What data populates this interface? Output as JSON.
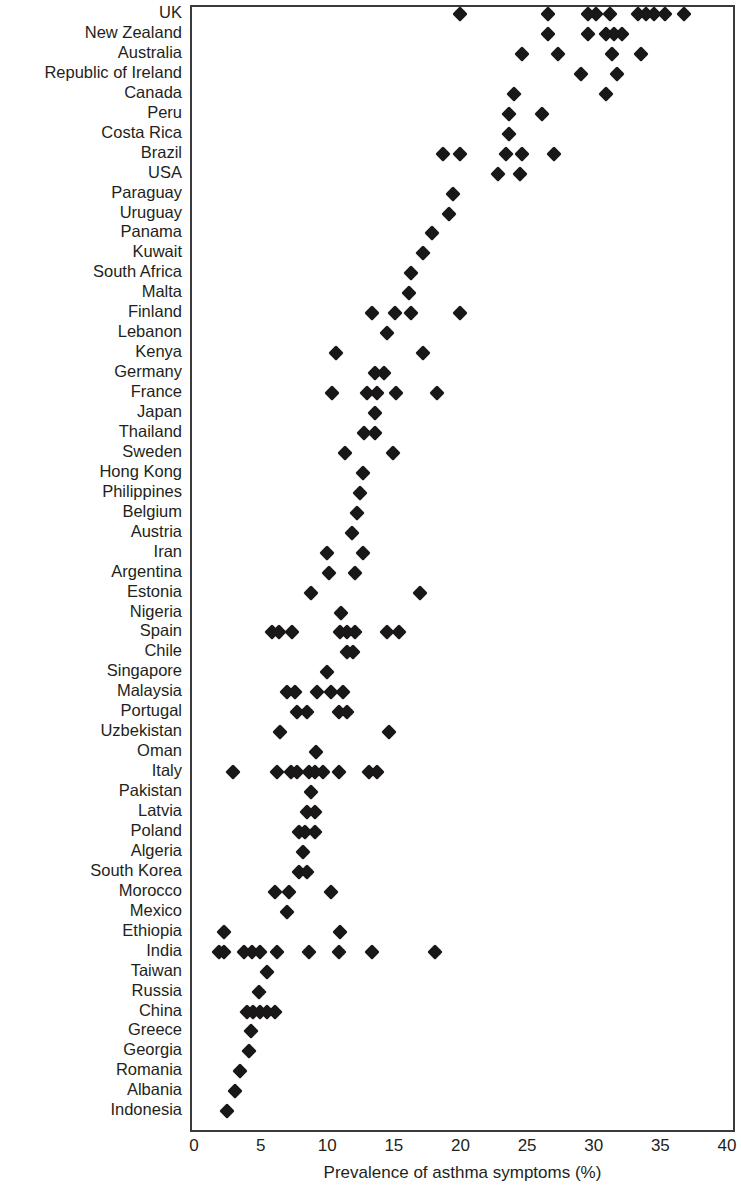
{
  "chart_data": {
    "type": "scatter",
    "title": "",
    "xlabel": "Prevalence of asthma symptoms (%)",
    "ylabel": "Country",
    "xlim": [
      0,
      40
    ],
    "xticks": [
      0,
      5,
      10,
      15,
      20,
      25,
      30,
      35,
      40
    ],
    "grid": false,
    "legend": null,
    "marker": "diamond",
    "marker_color": "#1a1718",
    "categories": [
      "UK",
      "New Zealand",
      "Australia",
      "Republic of Ireland",
      "Canada",
      "Peru",
      "Costa Rica",
      "Brazil",
      "USA",
      "Paraguay",
      "Uruguay",
      "Panama",
      "Kuwait",
      "South Africa",
      "Malta",
      "Finland",
      "Lebanon",
      "Kenya",
      "Germany",
      "France",
      "Japan",
      "Thailand",
      "Sweden",
      "Hong Kong",
      "Philippines",
      "Belgium",
      "Austria",
      "Iran",
      "Argentina",
      "Estonia",
      "Nigeria",
      "Spain",
      "Chile",
      "Singapore",
      "Malaysia",
      "Portugal",
      "Uzbekistan",
      "Oman",
      "Italy",
      "Pakistan",
      "Latvia",
      "Poland",
      "Algeria",
      "South Korea",
      "Morocco",
      "Mexico",
      "Ethiopia",
      "India",
      "Taiwan",
      "Russia",
      "China",
      "Greece",
      "Georgia",
      "Romania",
      "Albania",
      "Indonesia"
    ],
    "points": [
      {
        "country": "UK",
        "values": [
          19.8,
          26.4,
          29.4,
          30.0,
          31.1,
          33.2,
          33.8,
          34.4,
          35.2,
          36.6
        ]
      },
      {
        "country": "New Zealand",
        "values": [
          26.4,
          29.4,
          30.8,
          31.4,
          32.0
        ]
      },
      {
        "country": "Australia",
        "values": [
          24.5,
          27.2,
          31.2,
          33.4
        ]
      },
      {
        "country": "Republic of Ireland",
        "values": [
          28.9,
          31.6
        ]
      },
      {
        "country": "Canada",
        "values": [
          23.9,
          30.8
        ]
      },
      {
        "country": "Peru",
        "values": [
          23.5,
          26.0
        ]
      },
      {
        "country": "Costa Rica",
        "values": [
          23.5
        ]
      },
      {
        "country": "Brazil",
        "values": [
          18.5,
          19.8,
          23.3,
          24.5,
          26.9
        ]
      },
      {
        "country": "USA",
        "values": [
          22.7,
          24.3
        ]
      },
      {
        "country": "Paraguay",
        "values": [
          19.3
        ]
      },
      {
        "country": "Uruguay",
        "values": [
          19.0
        ]
      },
      {
        "country": "Panama",
        "values": [
          17.7
        ]
      },
      {
        "country": "Kuwait",
        "values": [
          17.0
        ]
      },
      {
        "country": "South Africa",
        "values": [
          16.1
        ]
      },
      {
        "country": "Malta",
        "values": [
          16.0
        ]
      },
      {
        "country": "Finland",
        "values": [
          13.2,
          14.9,
          16.1,
          19.8
        ]
      },
      {
        "country": "Lebanon",
        "values": [
          14.3
        ]
      },
      {
        "country": "Kenya",
        "values": [
          10.5,
          17.0
        ]
      },
      {
        "country": "Germany",
        "values": [
          13.4,
          14.1
        ]
      },
      {
        "country": "France",
        "values": [
          10.2,
          12.8,
          13.6,
          15.0,
          18.1
        ]
      },
      {
        "country": "Japan",
        "values": [
          13.4
        ]
      },
      {
        "country": "Thailand",
        "values": [
          12.6,
          13.4
        ]
      },
      {
        "country": "Sweden",
        "values": [
          11.2,
          14.8
        ]
      },
      {
        "country": "Hong Kong",
        "values": [
          12.5
        ]
      },
      {
        "country": "Philippines",
        "values": [
          12.3
        ]
      },
      {
        "country": "Belgium",
        "values": [
          12.1
        ]
      },
      {
        "country": "Austria",
        "values": [
          11.7
        ]
      },
      {
        "country": "Iran",
        "values": [
          9.8,
          12.5
        ]
      },
      {
        "country": "Argentina",
        "values": [
          10.0,
          11.9
        ]
      },
      {
        "country": "Estonia",
        "values": [
          8.6,
          16.8
        ]
      },
      {
        "country": "Nigeria",
        "values": [
          10.9
        ]
      },
      {
        "country": "Spain",
        "values": [
          5.7,
          6.2,
          7.2,
          10.8,
          11.3,
          11.9,
          14.3,
          15.2
        ]
      },
      {
        "country": "Chile",
        "values": [
          11.3,
          11.8
        ]
      },
      {
        "country": "Singapore",
        "values": [
          9.8
        ]
      },
      {
        "country": "Malaysia",
        "values": [
          6.8,
          7.4,
          9.1,
          10.1,
          11.0
        ]
      },
      {
        "country": "Portugal",
        "values": [
          7.6,
          8.3,
          10.7,
          11.3
        ]
      },
      {
        "country": "Uzbekistan",
        "values": [
          6.3,
          14.5
        ]
      },
      {
        "country": "Oman",
        "values": [
          9.0
        ]
      },
      {
        "country": "Italy",
        "values": [
          2.8,
          6.1,
          7.1,
          7.6,
          8.5,
          8.9,
          9.5,
          10.7,
          13.0,
          13.6
        ]
      },
      {
        "country": "Pakistan",
        "values": [
          8.6
        ]
      },
      {
        "country": "Latvia",
        "values": [
          8.3,
          8.9
        ]
      },
      {
        "country": "Poland",
        "values": [
          7.7,
          8.2,
          8.9
        ]
      },
      {
        "country": "Algeria",
        "values": [
          8.0
        ]
      },
      {
        "country": "South Korea",
        "values": [
          7.7,
          8.3
        ]
      },
      {
        "country": "Morocco",
        "values": [
          5.9,
          7.0,
          10.1
        ]
      },
      {
        "country": "Mexico",
        "values": [
          6.8
        ]
      },
      {
        "country": "Ethiopia",
        "values": [
          2.1,
          10.8
        ]
      },
      {
        "country": "India",
        "values": [
          1.7,
          2.1,
          3.6,
          4.2,
          4.8,
          6.1,
          8.5,
          10.7,
          13.2,
          17.9
        ]
      },
      {
        "country": "Taiwan",
        "values": [
          5.3
        ]
      },
      {
        "country": "Russia",
        "values": [
          4.7
        ]
      },
      {
        "country": "China",
        "values": [
          3.8,
          4.3,
          4.8,
          5.3,
          5.9
        ]
      },
      {
        "country": "Greece",
        "values": [
          4.1
        ]
      },
      {
        "country": "Georgia",
        "values": [
          4.0
        ]
      },
      {
        "country": "Romania",
        "values": [
          3.3
        ]
      },
      {
        "country": "Albania",
        "values": [
          2.9
        ]
      },
      {
        "country": "Indonesia",
        "values": [
          2.3
        ]
      }
    ]
  }
}
